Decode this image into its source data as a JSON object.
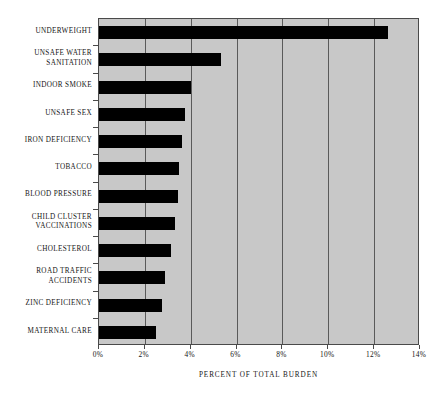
{
  "chart_data": {
    "type": "bar",
    "orientation": "horizontal",
    "title": "",
    "subtitle": "",
    "xlabel": "PERCENT OF TOTAL BURDEN",
    "ylabel": "",
    "xlim": [
      0,
      14
    ],
    "ylim": null,
    "grid": true,
    "legend": null,
    "legend_position": "none",
    "xtick_labels": [
      "0%",
      "2%",
      "4%",
      "6%",
      "8%",
      "10%",
      "12%",
      "14%"
    ],
    "xtick_values": [
      0,
      2,
      4,
      6,
      8,
      10,
      12,
      14
    ],
    "categories": [
      "UNDERWEIGHT",
      "UNSAFE  WATER SANITATION",
      "INDOOR SMOKE",
      "UNSAFE SEX",
      "IRON DEFICIENCY",
      "TOBACCO",
      "BLOOD PRESSURE",
      "CHILD CLUSTER VACCINATIONS",
      "CHOLESTEROL",
      "ROAD TRAFFIC ACCIDENTS",
      "ZINC DEFICIENCY",
      "MATERNAL CARE"
    ],
    "category_lines": [
      [
        "UNDERWEIGHT"
      ],
      [
        "UNSAFE  WATER",
        "SANITATION"
      ],
      [
        "INDOOR SMOKE"
      ],
      [
        "UNSAFE SEX"
      ],
      [
        "IRON DEFICIENCY"
      ],
      [
        "TOBACCO"
      ],
      [
        "BLOOD PRESSURE"
      ],
      [
        "CHILD CLUSTER",
        "VACCINATIONS"
      ],
      [
        "CHOLESTEROL"
      ],
      [
        "ROAD TRAFFIC",
        "ACCIDENTS"
      ],
      [
        "ZINC DEFICIENCY"
      ],
      [
        "MATERNAL CARE"
      ]
    ],
    "values": [
      12.6,
      5.3,
      4.0,
      3.75,
      3.6,
      3.5,
      3.45,
      3.3,
      3.15,
      2.9,
      2.75,
      2.5
    ],
    "units": "percent"
  },
  "style": {
    "plot_background": "#c8c8c8",
    "bar_color": "#000000",
    "axis_color": "#4a4a4a",
    "gridline_color": "#5a5a5a",
    "page_background": "#ffffff",
    "text_color": "#151515"
  }
}
